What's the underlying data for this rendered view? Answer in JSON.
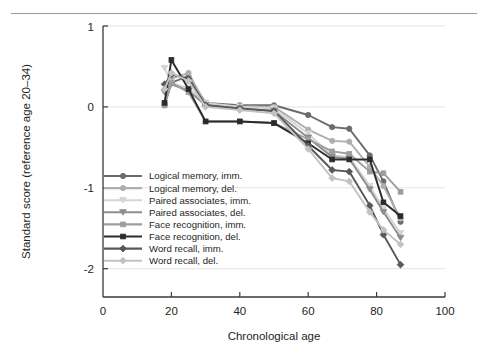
{
  "figure": {
    "has_top_rule": true,
    "background_color": "#ffffff"
  },
  "chart_data": {
    "type": "line",
    "title": "",
    "xlabel": "Chronological age",
    "ylabel": "Standard score (reference age 20–34)",
    "xlim": [
      0,
      100
    ],
    "ylim": [
      -2.35,
      1.0
    ],
    "xticks": [
      0,
      20,
      40,
      60,
      80,
      100
    ],
    "xticklabels": [
      "0",
      "20",
      "40",
      "60",
      "80",
      "100"
    ],
    "yticks": [
      1,
      0,
      -1,
      -2
    ],
    "yticklabels": [
      "1",
      "0",
      "-1",
      "-2"
    ],
    "grid": "horizontal-light",
    "legend_position": "lower-left-inside",
    "series": [
      {
        "name": "Logical memory, imm.",
        "marker": "circle",
        "color": "#6b6b6b",
        "x": [
          18,
          20,
          25,
          30,
          40,
          50,
          60,
          67,
          72,
          78,
          82,
          87
        ],
        "y": [
          0.02,
          0.3,
          0.38,
          0.05,
          0.02,
          0.02,
          -0.1,
          -0.25,
          -0.27,
          -0.6,
          -0.92,
          -1.42
        ]
      },
      {
        "name": "Logical memory, del.",
        "marker": "circle",
        "color": "#aeaeae",
        "x": [
          18,
          20,
          25,
          30,
          40,
          50,
          60,
          67,
          72,
          78,
          82,
          87
        ],
        "y": [
          0.05,
          0.35,
          0.42,
          0.03,
          0.01,
          0.0,
          -0.28,
          -0.42,
          -0.43,
          -0.74,
          -0.98,
          -1.38
        ]
      },
      {
        "name": "Paired associates, imm.",
        "marker": "triangle-down",
        "color": "#d4d4d4",
        "x": [
          18,
          20,
          25,
          30,
          40,
          50,
          60,
          67,
          72,
          78,
          82,
          87
        ],
        "y": [
          0.48,
          0.3,
          0.23,
          0.05,
          0.0,
          -0.02,
          -0.33,
          -0.6,
          -0.62,
          -0.98,
          -1.26,
          -1.56
        ]
      },
      {
        "name": "Paired associates, del.",
        "marker": "triangle-down",
        "color": "#8d8d8d",
        "x": [
          18,
          20,
          25,
          30,
          40,
          50,
          60,
          67,
          72,
          78,
          82,
          87
        ],
        "y": [
          0.18,
          0.28,
          0.2,
          0.02,
          -0.02,
          -0.05,
          -0.38,
          -0.62,
          -0.64,
          -1.02,
          -1.3,
          -1.62
        ]
      },
      {
        "name": "Face recognition, imm.",
        "marker": "square",
        "color": "#9d9d9d",
        "x": [
          18,
          20,
          25,
          30,
          40,
          50,
          60,
          67,
          72,
          78,
          82,
          87
        ],
        "y": [
          0.02,
          0.3,
          0.18,
          -0.18,
          -0.18,
          -0.2,
          -0.4,
          -0.55,
          -0.58,
          -0.8,
          -0.82,
          -1.05
        ]
      },
      {
        "name": "Face recognition, del.",
        "marker": "square",
        "color": "#2b2b2b",
        "x": [
          18,
          20,
          25,
          30,
          40,
          50,
          60,
          67,
          72,
          78,
          82,
          87
        ],
        "y": [
          0.05,
          0.58,
          0.22,
          -0.18,
          -0.18,
          -0.2,
          -0.45,
          -0.65,
          -0.65,
          -0.65,
          -1.18,
          -1.35
        ]
      },
      {
        "name": "Word recall, imm.",
        "marker": "diamond",
        "color": "#585858",
        "x": [
          18,
          20,
          25,
          30,
          40,
          50,
          60,
          67,
          72,
          78,
          82,
          87
        ],
        "y": [
          0.28,
          0.4,
          0.35,
          0.02,
          -0.02,
          -0.05,
          -0.48,
          -0.78,
          -0.8,
          -1.22,
          -1.58,
          -1.95
        ]
      },
      {
        "name": "Word recall, del.",
        "marker": "diamond",
        "color": "#c2c2c2",
        "x": [
          18,
          20,
          25,
          30,
          40,
          50,
          60,
          67,
          72,
          78,
          82,
          87
        ],
        "y": [
          0.22,
          0.42,
          0.32,
          0.0,
          -0.04,
          -0.08,
          -0.52,
          -0.88,
          -0.92,
          -1.3,
          -1.52,
          -1.7
        ]
      }
    ],
    "legend": [
      {
        "label": "Logical memory, imm.",
        "marker": "circle",
        "color": "#6b6b6b"
      },
      {
        "label": "Logical memory, del.",
        "marker": "circle",
        "color": "#aeaeae"
      },
      {
        "label": "Paired associates, imm.",
        "marker": "triangle-down",
        "color": "#d4d4d4"
      },
      {
        "label": "Paired associates, del.",
        "marker": "triangle-down",
        "color": "#8d8d8d"
      },
      {
        "label": "Face recognition, imm.",
        "marker": "square",
        "color": "#9d9d9d"
      },
      {
        "label": "Face recognition, del.",
        "marker": "square",
        "color": "#2b2b2b"
      },
      {
        "label": "Word recall, imm.",
        "marker": "diamond",
        "color": "#585858"
      },
      {
        "label": "Word recall, del.",
        "marker": "diamond",
        "color": "#c2c2c2"
      }
    ]
  }
}
